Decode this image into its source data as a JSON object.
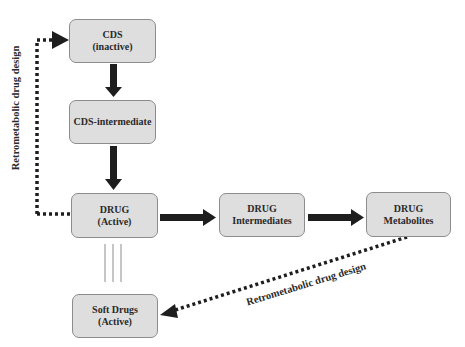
{
  "diagram": {
    "nodes": {
      "cds": {
        "line1": "CDS",
        "line2": "(inactive)"
      },
      "cds_intermediate": {
        "line1": "CDS-intermediate"
      },
      "drug_active": {
        "line1": "DRUG",
        "line2": "(Active)"
      },
      "drug_intermediates": {
        "line1": "DRUG",
        "line2": "Intermediates"
      },
      "drug_metabolites": {
        "line1": "DRUG",
        "line2": "Metabolites"
      },
      "soft_drugs": {
        "line1": "Soft Drugs",
        "line2": "(Active)"
      }
    },
    "edges": [
      {
        "from": "CDS (inactive)",
        "to": "CDS-intermediate",
        "style": "solid-arrow"
      },
      {
        "from": "CDS-intermediate",
        "to": "DRUG (Active)",
        "style": "solid-arrow"
      },
      {
        "from": "DRUG (Active)",
        "to": "DRUG Intermediates",
        "style": "solid-arrow"
      },
      {
        "from": "DRUG Intermediates",
        "to": "DRUG Metabolites",
        "style": "solid-arrow"
      },
      {
        "from": "DRUG (Active)",
        "to": "CDS (inactive)",
        "style": "dotted-arrow",
        "label": "Retrometabolic drug design"
      },
      {
        "from": "DRUG Metabolites",
        "to": "Soft Drugs (Active)",
        "style": "dotted-arrow",
        "label": "Retrometabolic drug design"
      },
      {
        "from": "DRUG (Active)",
        "to": "Soft Drugs (Active)",
        "style": "triple-line"
      }
    ],
    "labels": {
      "left_vertical": "Retrometabolic drug design",
      "bottom_diagonal": "Retrometabolic drug design"
    },
    "colors": {
      "box_fill": "#dedede",
      "box_border": "#8c8c8c",
      "arrow": "#1e1e1e",
      "text": "#2a2a2a"
    }
  }
}
